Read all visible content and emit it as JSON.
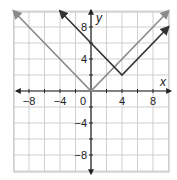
{
  "chart_data": {
    "type": "line",
    "title": "",
    "xlabel": "x",
    "ylabel": "y",
    "xlim": [
      -10,
      10
    ],
    "ylim": [
      -10,
      10
    ],
    "grid": true,
    "grid_step": 2,
    "x_ticks": [
      -8,
      -4,
      0,
      4,
      8
    ],
    "y_ticks": [
      8,
      4,
      -4,
      -8
    ],
    "x_tick_labels": [
      "−8",
      "−4",
      "0",
      "4",
      "8"
    ],
    "y_tick_labels": [
      "8",
      "4",
      "−4",
      "−8"
    ],
    "origin_label": "0",
    "series": [
      {
        "name": "y = |x|",
        "color": "#8a8a8a",
        "points": [
          [
            -10,
            10
          ],
          [
            0,
            0
          ],
          [
            10,
            10
          ]
        ],
        "arrows": "both"
      },
      {
        "name": "y = |x − 4| + 2",
        "color": "#333333",
        "points": [
          [
            -4,
            10
          ],
          [
            4,
            2
          ],
          [
            10,
            8
          ]
        ],
        "arrows": "both"
      }
    ]
  },
  "labels": {
    "x_axis": "x",
    "y_axis": "y",
    "origin": "0",
    "x_ticks": [
      "−8",
      "−4",
      "4",
      "8"
    ],
    "y_ticks": [
      "8",
      "4",
      "−4",
      "−8"
    ]
  }
}
